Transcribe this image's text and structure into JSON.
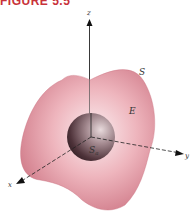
{
  "figure": {
    "title": "FIGURE 5.5"
  },
  "labels": {
    "z_axis": "z",
    "y_axis": "y",
    "x_axis": "x",
    "outer_surface": "S",
    "region": "E",
    "inner_sphere": "S",
    "inner_sphere_sub": "a"
  },
  "colors": {
    "title": "#c8323a",
    "region_fill": "#e9a2ad",
    "region_edge": "#c9707f",
    "sphere_dark": "#3a2228",
    "sphere_light": "#c7b0b5",
    "axis": "#222222"
  }
}
